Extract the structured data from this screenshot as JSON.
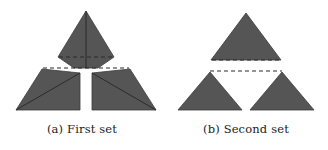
{
  "figure": {
    "background_color": "#ffffff",
    "shape_fill_color": "#555555",
    "shape_stroke_color": "#3b3b3b",
    "fold_line_color": "#2b2b2b",
    "dashed_line_color": "#2b2b2b",
    "caption_color": "#222222"
  },
  "subfigures": [
    {
      "id": "a",
      "caption": "(a) First set",
      "label": "(a)",
      "name": "First set",
      "piece_count": 3,
      "pieces": [
        {
          "name": "top-piece",
          "kind": "folded-pentagon",
          "points": "58,11 58,11 86,11 114,57 86,68 58,57",
          "outline": "86,11 114,57 98,68 86,68 74,68 58,57",
          "fold_lines": [
            {
              "name": "vertical-fold",
              "x1": 86,
              "y1": 11,
              "x2": 86,
              "y2": 68,
              "style": "solid"
            },
            {
              "name": "horizontal-crease",
              "x1": 59,
              "y1": 57,
              "x2": 113,
              "y2": 57,
              "style": "dashed"
            }
          ]
        },
        {
          "name": "bottom-left-piece",
          "kind": "folded-quadrilateral",
          "outline": "42,69 80,73 80,110 16,110",
          "fold_lines": [
            {
              "name": "diagonal-fold",
              "x1": 16,
              "y1": 110,
              "x2": 80,
              "y2": 73,
              "style": "solid"
            }
          ]
        },
        {
          "name": "bottom-right-piece",
          "kind": "folded-quadrilateral",
          "outline": "130,69 92,73 92,110 156,110",
          "fold_lines": [
            {
              "name": "diagonal-fold",
              "x1": 156,
              "y1": 110,
              "x2": 92,
              "y2": 73,
              "style": "solid"
            }
          ]
        }
      ],
      "guides": [
        {
          "name": "span-dashed-guide",
          "x1": 43,
          "y1": 68,
          "x2": 129,
          "y2": 68,
          "style": "dashed"
        }
      ]
    },
    {
      "id": "b",
      "caption": "(b) Second set",
      "label": "(b)",
      "name": "Second set",
      "piece_count": 3,
      "pieces": [
        {
          "name": "top-piece",
          "kind": "triangle",
          "outline": "82,13 117,60 47,60",
          "fold_lines": []
        },
        {
          "name": "bottom-left-piece",
          "kind": "triangle",
          "outline": "46,72 78,110 14,110",
          "fold_lines": []
        },
        {
          "name": "bottom-right-piece",
          "kind": "triangle",
          "outline": "118,72 150,110 86,110",
          "fold_lines": []
        }
      ],
      "guides": [
        {
          "name": "base-dashed-guide",
          "x1": 48,
          "y1": 60,
          "x2": 116,
          "y2": 60,
          "style": "dashed"
        },
        {
          "name": "span-dashed-guide",
          "x1": 46,
          "y1": 71,
          "x2": 118,
          "y2": 71,
          "style": "dashed"
        }
      ]
    }
  ]
}
